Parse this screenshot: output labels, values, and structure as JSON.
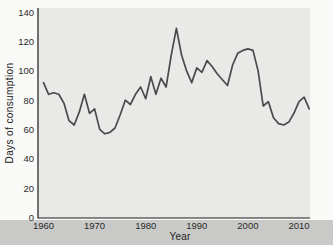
{
  "chart_data": {
    "type": "line",
    "xlabel": "Year",
    "ylabel": "Days of consumption",
    "x": [
      1960,
      1961,
      1962,
      1963,
      1964,
      1965,
      1966,
      1967,
      1968,
      1969,
      1970,
      1971,
      1972,
      1973,
      1974,
      1975,
      1976,
      1977,
      1978,
      1979,
      1980,
      1981,
      1982,
      1983,
      1984,
      1985,
      1986,
      1987,
      1988,
      1989,
      1990,
      1991,
      1992,
      1993,
      1994,
      1995,
      1996,
      1997,
      1998,
      1999,
      2000,
      2001,
      2002,
      2003,
      2004,
      2005,
      2006,
      2007,
      2008,
      2009,
      2010,
      2011,
      2012
    ],
    "values": [
      92,
      84,
      85,
      84,
      78,
      66,
      63,
      72,
      84,
      71,
      74,
      60,
      57,
      58,
      61,
      70,
      80,
      77,
      84,
      89,
      81,
      96,
      84,
      95,
      89,
      111,
      129,
      111,
      100,
      92,
      102,
      99,
      107,
      103,
      98,
      94,
      90,
      104,
      112,
      114,
      115,
      114,
      100,
      76,
      79,
      68,
      64,
      63,
      65,
      71,
      79,
      82,
      74
    ],
    "x_ticks": [
      1960,
      1970,
      1980,
      1990,
      2000,
      2010
    ],
    "y_ticks": [
      0,
      20,
      40,
      60,
      80,
      100,
      120,
      140
    ],
    "xlim": [
      1959,
      2013
    ],
    "ylim": [
      0,
      140
    ],
    "grid": false,
    "legend": "none",
    "line_color": "#4a4a4a",
    "panel_bg": "#e9e9e7",
    "axis_color": "#1c1c1c",
    "tick_label_color": "#2a2a2a"
  },
  "page": {
    "bg_color": "#f9f9f7",
    "bottom_band_color": "#c9c9c7"
  }
}
